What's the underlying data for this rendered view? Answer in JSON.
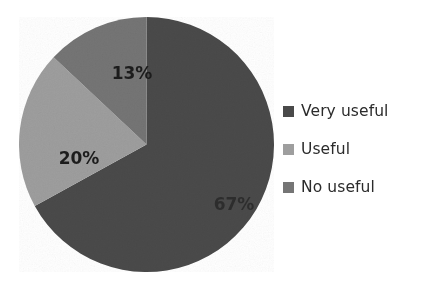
{
  "chart_data": {
    "type": "pie",
    "title": "",
    "categories": [
      "Very useful",
      "Useful",
      "No useful"
    ],
    "values": [
      67,
      20,
      13
    ],
    "value_labels": [
      "67%",
      "20%",
      "13%"
    ],
    "unit": "%",
    "total": 100,
    "colors": [
      "#4a4a4a",
      "#9e9e9e",
      "#757575"
    ],
    "legend_position": "right",
    "grid": false,
    "start_angle_deg": 0,
    "direction": "clockwise",
    "slices": [
      {
        "label": "Very useful",
        "value": 67,
        "value_label": "67%",
        "color": "#4a4a4a",
        "start_deg": 0.0,
        "end_deg": 241.2,
        "label_x": 215,
        "label_y": 193
      },
      {
        "label": "Useful",
        "value": 20,
        "value_label": "20%",
        "color": "#9e9e9e",
        "start_deg": 241.2,
        "end_deg": 313.2,
        "label_x": 60,
        "label_y": 147
      },
      {
        "label": "No useful",
        "value": 13,
        "value_label": "13%",
        "color": "#757575",
        "start_deg": 313.2,
        "end_deg": 360.0,
        "label_x": 113,
        "label_y": 62
      }
    ]
  },
  "legend": {
    "items": [
      {
        "label": "Very useful",
        "color": "#4a4a4a"
      },
      {
        "label": "Useful",
        "color": "#9e9e9e"
      },
      {
        "label": "No useful",
        "color": "#757575"
      }
    ]
  },
  "background_color": "#ffffff"
}
